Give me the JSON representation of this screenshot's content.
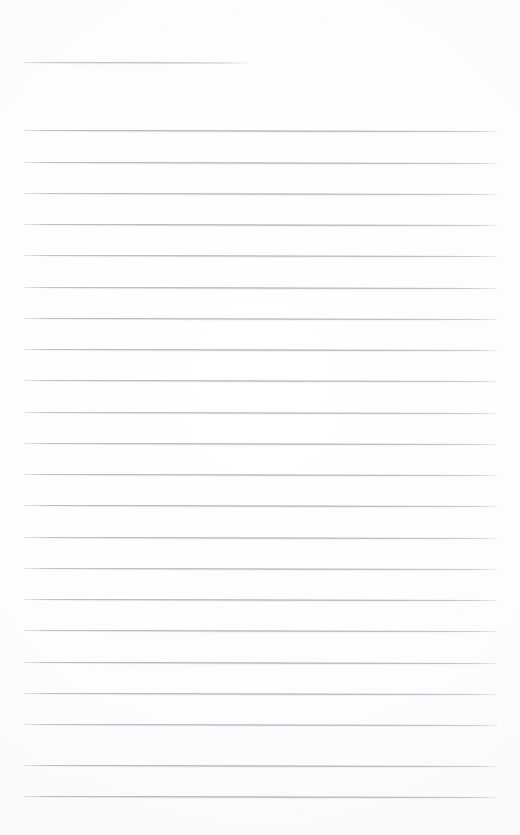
{
  "document": {
    "kind": "ruled-paper-scan",
    "title": "Blank lined notebook page",
    "page_width": 520,
    "page_height": 835,
    "background_color": "#fdfdfd",
    "rule_color": "#8b9099",
    "rule_thickness_px": 1,
    "content_text": ""
  },
  "layout": {
    "left_margin_x": 24,
    "right_margin_x": 497,
    "rule_spacing_px": 31.3,
    "skew_degrees": 0.12,
    "header_rule_count": 1,
    "body_rule_count": 22,
    "total_rule_count": 23
  },
  "rules": [
    {
      "name": "header-rule",
      "y": 62,
      "x": 24,
      "width": 224,
      "short": true,
      "opacity": 0.82
    },
    {
      "name": "body-rule-1",
      "y": 130,
      "x": 24,
      "width": 473,
      "short": false,
      "opacity": 0.9
    },
    {
      "name": "body-rule-2",
      "y": 161.5,
      "x": 24,
      "width": 473,
      "short": false,
      "opacity": 0.88
    },
    {
      "name": "body-rule-3",
      "y": 192.5,
      "x": 24,
      "width": 473,
      "short": false,
      "opacity": 0.86
    },
    {
      "name": "body-rule-4",
      "y": 224,
      "x": 24,
      "width": 473,
      "short": false,
      "opacity": 0.9
    },
    {
      "name": "body-rule-5",
      "y": 255,
      "x": 24,
      "width": 473,
      "short": false,
      "opacity": 0.87
    },
    {
      "name": "body-rule-6",
      "y": 286.5,
      "x": 24,
      "width": 473,
      "short": false,
      "opacity": 0.89
    },
    {
      "name": "body-rule-7",
      "y": 317.5,
      "x": 24,
      "width": 473,
      "short": false,
      "opacity": 0.86
    },
    {
      "name": "body-rule-8",
      "y": 349,
      "x": 24,
      "width": 473,
      "short": false,
      "opacity": 0.9
    },
    {
      "name": "body-rule-9",
      "y": 380,
      "x": 24,
      "width": 473,
      "short": false,
      "opacity": 0.88
    },
    {
      "name": "body-rule-10",
      "y": 411.5,
      "x": 24,
      "width": 473,
      "short": false,
      "opacity": 0.86
    },
    {
      "name": "body-rule-11",
      "y": 442.5,
      "x": 24,
      "width": 473,
      "short": false,
      "opacity": 0.89
    },
    {
      "name": "body-rule-12",
      "y": 474,
      "x": 24,
      "width": 473,
      "short": false,
      "opacity": 0.87
    },
    {
      "name": "body-rule-13",
      "y": 505,
      "x": 24,
      "width": 473,
      "short": false,
      "opacity": 0.9
    },
    {
      "name": "body-rule-14",
      "y": 536.5,
      "x": 24,
      "width": 473,
      "short": false,
      "opacity": 0.88
    },
    {
      "name": "body-rule-15",
      "y": 567.5,
      "x": 24,
      "width": 473,
      "short": false,
      "opacity": 0.86
    },
    {
      "name": "body-rule-16",
      "y": 599,
      "x": 24,
      "width": 473,
      "short": false,
      "opacity": 0.89
    },
    {
      "name": "body-rule-17",
      "y": 630,
      "x": 24,
      "width": 473,
      "short": false,
      "opacity": 0.87
    },
    {
      "name": "body-rule-18",
      "y": 661.5,
      "x": 24,
      "width": 473,
      "short": false,
      "opacity": 0.9
    },
    {
      "name": "body-rule-19",
      "y": 692.5,
      "x": 24,
      "width": 473,
      "short": false,
      "opacity": 0.88
    },
    {
      "name": "body-rule-20",
      "y": 724,
      "x": 24,
      "width": 473,
      "short": false,
      "opacity": 0.86
    },
    {
      "name": "body-rule-21",
      "y": 765,
      "x": 24,
      "width": 473,
      "short": false,
      "opacity": 0.9
    },
    {
      "name": "body-rule-22",
      "y": 796,
      "x": 24,
      "width": 473,
      "short": false,
      "opacity": 0.92
    }
  ]
}
